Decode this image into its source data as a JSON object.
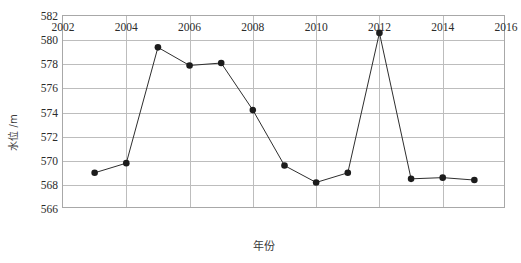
{
  "chart_data": {
    "type": "line",
    "title": "",
    "xlabel": "年份",
    "ylabel": "水位 / m",
    "ylabel_text": "水位 /m",
    "xlim": [
      2002,
      2016
    ],
    "ylim": [
      566,
      582
    ],
    "xticks": [
      2002,
      2004,
      2006,
      2008,
      2010,
      2012,
      2014,
      2016
    ],
    "yticks": [
      566,
      568,
      570,
      572,
      574,
      576,
      578,
      580,
      582
    ],
    "grid": true,
    "legend": "none",
    "marker": "filled-circle",
    "x": [
      2003,
      2004,
      2005,
      2006,
      2007,
      2008,
      2009,
      2010,
      2011,
      2012,
      2013,
      2014,
      2015
    ],
    "values": [
      569.0,
      569.8,
      579.4,
      577.9,
      578.1,
      574.2,
      569.6,
      568.2,
      569.0,
      580.6,
      568.5,
      568.6,
      568.4
    ],
    "series": [
      {
        "name": "水位",
        "x": [
          2003,
          2004,
          2005,
          2006,
          2007,
          2008,
          2009,
          2010,
          2011,
          2012,
          2013,
          2014,
          2015
        ],
        "values": [
          569.0,
          569.8,
          579.4,
          577.9,
          578.1,
          574.2,
          569.6,
          568.2,
          569.0,
          580.6,
          568.5,
          568.6,
          568.4
        ]
      }
    ],
    "xtick_labels": [
      "2002",
      "2004",
      "2006",
      "2008",
      "2010",
      "2012",
      "2014",
      "2016"
    ],
    "ytick_labels": [
      "566",
      "568",
      "570",
      "572",
      "574",
      "576",
      "578",
      "580",
      "582"
    ]
  },
  "axes": {
    "y_title": "水位 /m",
    "x_title": "年份"
  }
}
